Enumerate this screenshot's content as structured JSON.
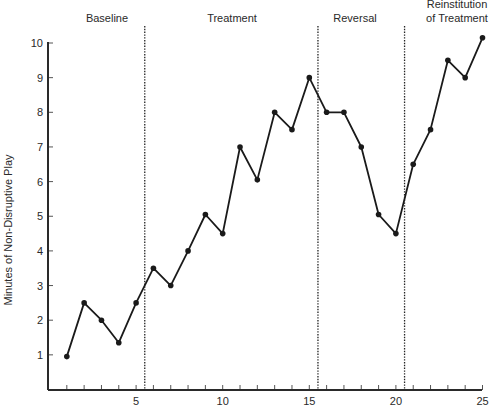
{
  "chart_data": {
    "type": "line",
    "title": "",
    "xlabel": "",
    "ylabel": "Minutes of Non-Disruptive Play",
    "xlim": [
      0,
      25
    ],
    "ylim": [
      0,
      10
    ],
    "x_ticks": [
      5,
      10,
      15,
      20,
      25
    ],
    "y_ticks": [
      1,
      2,
      3,
      4,
      5,
      6,
      7,
      8,
      9,
      10
    ],
    "grid": false,
    "legend": null,
    "phases": [
      {
        "label": "Baseline",
        "start": 0.5,
        "end": 5.5
      },
      {
        "label": "Treatment",
        "start": 5.5,
        "end": 15.5
      },
      {
        "label": "Reversal",
        "start": 15.5,
        "end": 20.5
      },
      {
        "label": "Reinstitution of Treatment",
        "label_lines": [
          "Reinstitution",
          "of Treatment"
        ],
        "start": 20.5,
        "end": 25
      }
    ],
    "phase_change_lines": [
      5.5,
      15.5,
      20.5
    ],
    "x": [
      1,
      2,
      3,
      4,
      5,
      6,
      7,
      8,
      9,
      10,
      11,
      12,
      13,
      14,
      15,
      16,
      17,
      18,
      19,
      20,
      21,
      22,
      23,
      24,
      25
    ],
    "series": [
      {
        "name": "Minutes of Non-Disruptive Play",
        "values": [
          0.95,
          2.5,
          2.0,
          1.35,
          2.5,
          3.5,
          3.0,
          4.0,
          5.05,
          4.5,
          7.0,
          6.05,
          8.0,
          7.5,
          9.0,
          8.0,
          8.0,
          7.0,
          5.05,
          4.5,
          6.5,
          7.5,
          9.5,
          9.0,
          10.15
        ]
      }
    ]
  },
  "colors": {
    "line": "#1a1a1a",
    "axis": "#2a2a2a",
    "background": "#ffffff"
  }
}
